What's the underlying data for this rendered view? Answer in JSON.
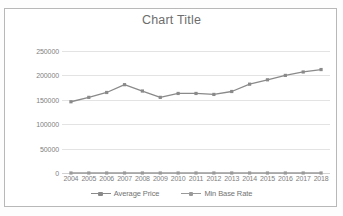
{
  "chart_data": {
    "type": "line",
    "title": "Chart Title",
    "xlabel": "",
    "ylabel": "",
    "categories": [
      "2004",
      "2005",
      "2006",
      "2007",
      "2008",
      "2009",
      "2010",
      "2011",
      "2012",
      "2013",
      "2014",
      "2015",
      "2016",
      "2017",
      "2018"
    ],
    "series": [
      {
        "name": "Average Price",
        "color": "#8a8a8a",
        "marker": "square",
        "values": [
          146000,
          155000,
          165000,
          181000,
          168000,
          155000,
          163000,
          163000,
          161000,
          167000,
          182000,
          191000,
          200000,
          207000,
          212000
        ]
      },
      {
        "name": "Min Base Rate",
        "color": "#9a9a9a",
        "marker": "square",
        "values": [
          0,
          0,
          0,
          0,
          0,
          0,
          0,
          0,
          0,
          0,
          0,
          0,
          0,
          0,
          0
        ]
      }
    ],
    "ylim": [
      0,
      250000
    ],
    "yticks": [
      0,
      50000,
      100000,
      150000,
      200000,
      250000
    ],
    "ytick_labels": [
      "0",
      "50000",
      "100000",
      "150000",
      "200000",
      "250000"
    ],
    "grid": true,
    "legend_position": "bottom",
    "plot_background": "#ffffff",
    "gridline_color": "#e3e3e3",
    "axis_text_color": "#808080",
    "title_color": "#6d6d6d"
  },
  "frame": {
    "border_color": "#b8b8b8",
    "background": "#ffffff"
  }
}
